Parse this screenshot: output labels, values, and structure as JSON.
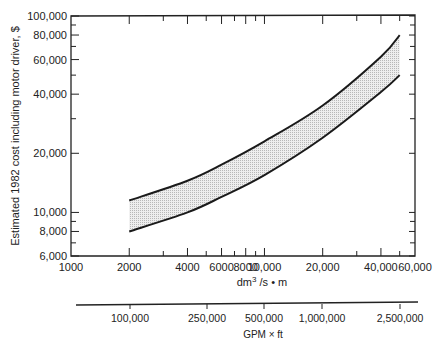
{
  "chart_data": {
    "type": "area",
    "title": "",
    "ylabel": "Estimated 1982 cost including motor driver, $",
    "xlabel": "dm³/s • m",
    "xlabel_secondary": "GPM × ft",
    "xscale": "log",
    "yscale": "log",
    "xlim": [
      1000,
      60000
    ],
    "ylim": [
      6000,
      100000
    ],
    "grid": false,
    "x_tick_labels": [
      "1000",
      "2000",
      "4000",
      "6000",
      "8000",
      "10,000",
      "20,000",
      "40,000",
      "60,000"
    ],
    "x_ticks": [
      1000,
      2000,
      4000,
      6000,
      8000,
      10000,
      20000,
      40000,
      60000
    ],
    "x_minor_ticks": [
      3000,
      5000,
      7000,
      9000,
      30000,
      50000
    ],
    "y_tick_labels": [
      "6,000",
      "8,000",
      "10,000",
      "20,000",
      "40,000",
      "60,000",
      "80,000",
      "100,000"
    ],
    "y_ticks": [
      6000,
      8000,
      10000,
      20000,
      40000,
      60000,
      80000,
      100000
    ],
    "y_minor_ticks": [
      7000,
      9000,
      30000,
      50000,
      70000,
      90000
    ],
    "secondary_x_tick_labels": [
      "100,000",
      "250,000",
      "500,000",
      "1,000,000",
      "2,500,000"
    ],
    "secondary_x_ticks": [
      100000,
      250000,
      500000,
      1000000,
      2500000
    ],
    "x": [
      2000,
      4000,
      6000,
      10000,
      20000,
      40000,
      50000
    ],
    "series": [
      {
        "name": "Upper bound",
        "values": [
          11500,
          14500,
          17500,
          23000,
          35000,
          62000,
          80000
        ]
      },
      {
        "name": "Lower bound",
        "values": [
          8000,
          10000,
          12000,
          15500,
          24000,
          41000,
          50000
        ]
      }
    ],
    "band_fill": "#d8d8d8",
    "line_color": "#1a1a1a"
  }
}
